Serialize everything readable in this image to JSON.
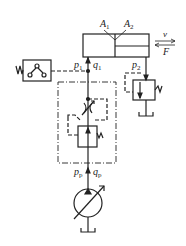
{
  "diagram": {
    "type": "hydraulic-circuit",
    "labels": {
      "A1": {
        "main": "A",
        "sub": "1"
      },
      "A2": {
        "main": "A",
        "sub": "2"
      },
      "v": "v",
      "F": "F",
      "p1": {
        "main": "p",
        "sub": "1"
      },
      "q1": {
        "main": "q",
        "sub": "1"
      },
      "p2": {
        "main": "p",
        "sub": "2"
      },
      "pp": {
        "main": "p",
        "sub": "p"
      },
      "qp": {
        "main": "q",
        "sub": "p"
      }
    },
    "components": [
      "hydraulic-cylinder",
      "pressure-switch",
      "throttle-valve",
      "pressure-compensating-valve",
      "relief-back-pressure-valve",
      "variable-displacement-pump",
      "tank"
    ],
    "colors": {
      "line": "#222222",
      "background": "#ffffff"
    }
  }
}
